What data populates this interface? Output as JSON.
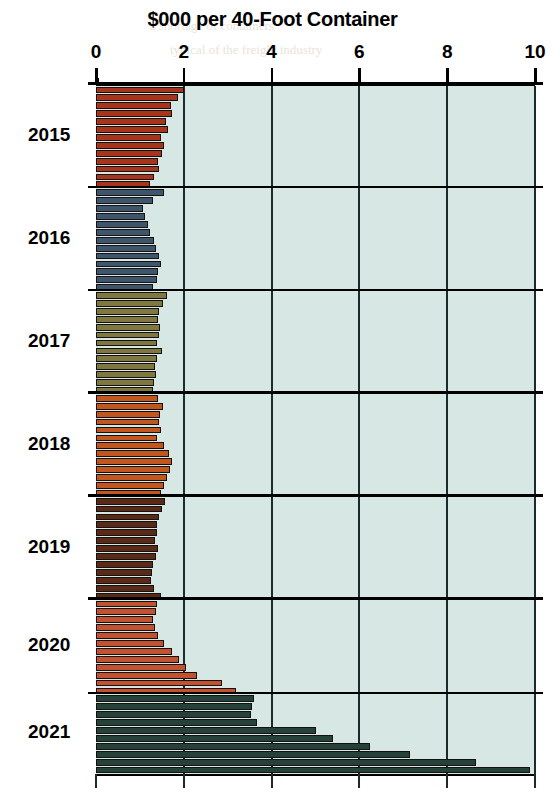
{
  "chart_data": {
    "type": "bar",
    "orientation": "horizontal",
    "title": "$000 per 40-Foot Container",
    "xlabel": "",
    "ylabel": "",
    "xlim": [
      0,
      10
    ],
    "xticks": [
      0,
      2,
      4,
      6,
      8,
      10
    ],
    "xtick_labels": [
      "0",
      "2",
      "4",
      "6",
      "8",
      "10"
    ],
    "grid": true,
    "legend": "none",
    "plot_background": "#d7e7e3",
    "year_groups": [
      {
        "label": "2015",
        "color": "#a8341a",
        "values": [
          2.0,
          1.86,
          1.7,
          1.72,
          1.6,
          1.64,
          1.48,
          1.56,
          1.5,
          1.42,
          1.44,
          1.32,
          1.22
        ]
      },
      {
        "label": "2016",
        "color": "#3d566e",
        "values": [
          1.54,
          1.3,
          1.08,
          1.12,
          1.18,
          1.24,
          1.32,
          1.36,
          1.44,
          1.48,
          1.42,
          1.38,
          1.3
        ]
      },
      {
        "label": "2017",
        "color": "#7e7840",
        "values": [
          1.62,
          1.52,
          1.44,
          1.42,
          1.46,
          1.44,
          1.4,
          1.5,
          1.38,
          1.34,
          1.36,
          1.32,
          1.3
        ]
      },
      {
        "label": "2018",
        "color": "#c2561f",
        "values": [
          1.42,
          1.52,
          1.46,
          1.44,
          1.48,
          1.4,
          1.56,
          1.66,
          1.72,
          1.68,
          1.62,
          1.56,
          1.48
        ]
      },
      {
        "label": "2019",
        "color": "#5a2a18",
        "values": [
          1.58,
          1.5,
          1.44,
          1.4,
          1.38,
          1.34,
          1.42,
          1.36,
          1.3,
          1.28,
          1.26,
          1.32,
          1.48
        ]
      },
      {
        "label": "2020",
        "color": "#c2512f",
        "values": [
          1.4,
          1.36,
          1.3,
          1.34,
          1.42,
          1.56,
          1.72,
          1.88,
          2.04,
          2.3,
          2.86,
          3.2
        ]
      },
      {
        "label": "2021",
        "color": "#24423a",
        "values": [
          3.6,
          3.56,
          3.52,
          3.66,
          5.02,
          5.4,
          6.24,
          7.16,
          8.66,
          9.88
        ]
      }
    ]
  },
  "background_bleed": [
    {
      "text": "a shortage of containers",
      "x": 150,
      "y": 18
    },
    {
      "text": "typical of the freight industry",
      "x": 170,
      "y": 42
    },
    {
      "text": "but the cost of shipping",
      "x": 185,
      "y": 112
    },
    {
      "text": "for the domestic carriers",
      "x": 190,
      "y": 140
    },
    {
      "text": "in was reported by ALAN",
      "x": 200,
      "y": 170
    },
    {
      "text": "as trade volumes rebound",
      "x": 195,
      "y": 200
    },
    {
      "text": "port congestion continued",
      "x": 200,
      "y": 232
    },
    {
      "text": "through the peak season",
      "x": 205,
      "y": 262
    },
    {
      "text": "causing rates to surge",
      "x": 215,
      "y": 292
    },
    {
      "text": "shippers pay more than ever",
      "x": 185,
      "y": 350
    },
    {
      "text": "to move a single container",
      "x": 195,
      "y": 378
    },
    {
      "text": "across the trans-Pacific",
      "x": 205,
      "y": 406
    },
    {
      "text": "and demand has been strong",
      "x": 185,
      "y": 492
    },
    {
      "text": "with capacity constrained",
      "x": 200,
      "y": 520
    },
    {
      "text": "the cost per FEU climbed",
      "x": 205,
      "y": 548
    },
    {
      "text": "to record highs this year",
      "x": 200,
      "y": 608
    },
    {
      "text": "and carriers booked record",
      "x": 190,
      "y": 636
    },
    {
      "text": "profits on the back of it",
      "x": 205,
      "y": 664
    }
  ]
}
